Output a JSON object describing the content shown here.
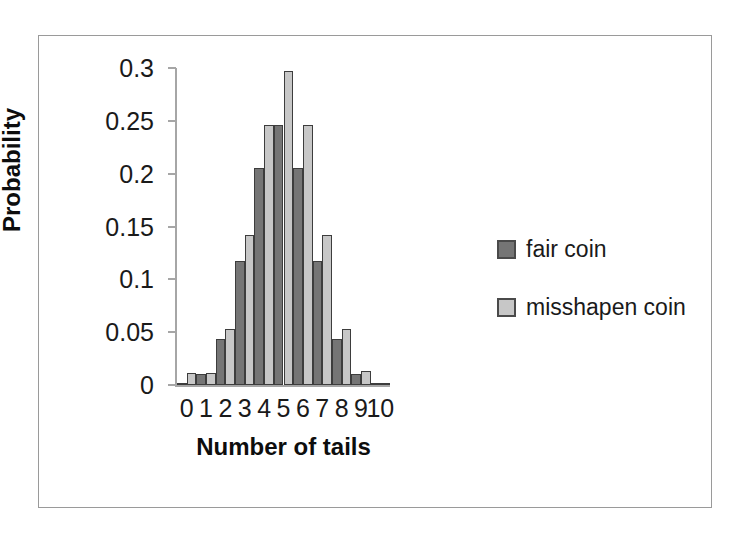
{
  "chart_data": {
    "type": "bar",
    "title": "",
    "xlabel": "Number of tails",
    "ylabel": "Probability",
    "categories": [
      "0",
      "1",
      "2",
      "3",
      "4",
      "5",
      "6",
      "7",
      "8",
      "9",
      "10"
    ],
    "series": [
      {
        "name": "fair coin",
        "color": "#757575",
        "values": [
          0.001,
          0.01,
          0.044,
          0.117,
          0.205,
          0.246,
          0.205,
          0.117,
          0.044,
          0.01,
          0.001
        ]
      },
      {
        "name": "misshapen coin",
        "color": "#c7c7c7",
        "values": [
          0.011,
          0.011,
          0.053,
          0.142,
          0.246,
          0.297,
          0.246,
          0.142,
          0.053,
          0.013,
          0.002
        ]
      }
    ],
    "ylim": [
      0,
      0.3
    ],
    "ytick_values": [
      0.3,
      0.25,
      0.2,
      0.15,
      0.1,
      0.05,
      0
    ],
    "ytick_labels": [
      "0.3",
      "0.25",
      "0.2",
      "0.15",
      "0.1",
      "0.05",
      "0"
    ],
    "grid": false,
    "legend_position": "right",
    "legend": [
      "fair coin",
      "misshapen coin"
    ],
    "axis_color": "#a6a6a6",
    "bar_border_color": "#3d3d3d",
    "frame_color": "#9a9a9a",
    "background": "#ffffff"
  },
  "axes": {
    "y_title": "Probability",
    "x_title": "Number of tails"
  },
  "legend": {
    "entries": [
      {
        "label": "fair coin",
        "swatch": "#757575"
      },
      {
        "label": "misshapen coin",
        "swatch": "#c7c7c7"
      }
    ]
  }
}
